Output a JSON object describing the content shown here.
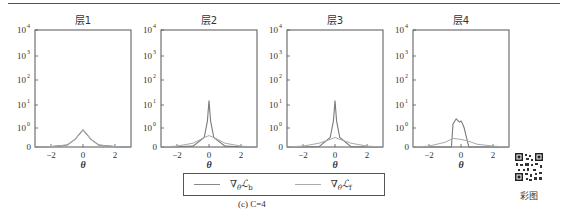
{
  "chart_data": [
    {
      "type": "line",
      "title": "层1",
      "xlabel": "θ",
      "ylabel": "",
      "yscale": "symlog",
      "xlim": [
        -3,
        3
      ],
      "ylim": [
        0,
        10000
      ],
      "xticks": [
        "-2",
        "0",
        "2"
      ],
      "yticks": [
        "0",
        "10^0",
        "10^1",
        "10^2",
        "10^3",
        "10^4"
      ],
      "grid": false,
      "series": [
        {
          "name": "∇θ L_b",
          "x": [
            -3,
            -2,
            -1,
            -0.5,
            0,
            0.5,
            1,
            2,
            3
          ],
          "values": [
            0,
            0.02,
            0.1,
            0.4,
            0.9,
            0.4,
            0.1,
            0.02,
            0
          ]
        },
        {
          "name": "∇θ L_f",
          "x": [
            -3,
            -2,
            -1,
            -0.5,
            0,
            0.5,
            1,
            2,
            3
          ],
          "values": [
            0,
            0.02,
            0.1,
            0.4,
            0.9,
            0.4,
            0.1,
            0.02,
            0
          ]
        }
      ]
    },
    {
      "type": "line",
      "title": "层2",
      "xlabel": "θ",
      "yscale": "symlog",
      "xlim": [
        -3,
        3
      ],
      "ylim": [
        0,
        10000
      ],
      "xticks": [
        "-2",
        "0",
        "2"
      ],
      "yticks": [
        "0",
        "10^0",
        "10^1",
        "10^2",
        "10^3",
        "10^4"
      ],
      "series": [
        {
          "name": "∇θ L_b",
          "x": [
            -3,
            -2,
            -1,
            -0.3,
            -0.1,
            0,
            0.1,
            0.3,
            1,
            2,
            3
          ],
          "values": [
            0,
            0.01,
            0.05,
            0.5,
            2,
            15,
            2,
            0.5,
            0.05,
            0.01,
            0
          ]
        },
        {
          "name": "∇θ L_f",
          "x": [
            -3,
            -2,
            -1,
            -0.3,
            0,
            0.3,
            1,
            2,
            3
          ],
          "values": [
            0,
            0.05,
            0.2,
            0.5,
            0.6,
            0.5,
            0.2,
            0.05,
            0
          ]
        }
      ]
    },
    {
      "type": "line",
      "title": "层3",
      "xlabel": "θ",
      "yscale": "symlog",
      "xlim": [
        -3,
        3
      ],
      "ylim": [
        0,
        10000
      ],
      "xticks": [
        "-2",
        "0",
        "2"
      ],
      "yticks": [
        "0",
        "10^0",
        "10^1",
        "10^2",
        "10^3",
        "10^4"
      ],
      "series": [
        {
          "name": "∇θ L_b",
          "x": [
            -3,
            -2,
            -1,
            -0.3,
            -0.1,
            0,
            0.1,
            0.3,
            1,
            2,
            3
          ],
          "values": [
            0,
            0,
            0.02,
            0.5,
            2,
            15,
            2,
            0.5,
            0.02,
            0,
            0
          ]
        },
        {
          "name": "∇θ L_f",
          "x": [
            -3,
            -2,
            -1,
            -0.3,
            0,
            0.3,
            1,
            2,
            3
          ],
          "values": [
            0,
            0.05,
            0.2,
            0.4,
            0.5,
            0.4,
            0.2,
            0.05,
            0
          ]
        }
      ]
    },
    {
      "type": "line",
      "title": "层4",
      "xlabel": "θ",
      "yscale": "symlog",
      "xlim": [
        -3,
        3
      ],
      "ylim": [
        0,
        10000
      ],
      "xticks": [
        "-2",
        "0",
        "2"
      ],
      "yticks": [
        "0",
        "10^0",
        "10^1",
        "10^2",
        "10^3",
        "10^4"
      ],
      "series": [
        {
          "name": "∇θ L_b",
          "x": [
            -3,
            -0.6,
            -0.5,
            -0.3,
            -0.1,
            0,
            0.1,
            0.2,
            0.4,
            0.5,
            3
          ],
          "values": [
            0,
            0,
            1.5,
            2.5,
            1.8,
            2,
            1.5,
            1,
            0.3,
            0,
            0
          ]
        },
        {
          "name": "∇θ L_f",
          "x": [
            -3,
            -2,
            -1,
            -0.5,
            0,
            0.5,
            1,
            2,
            3
          ],
          "values": [
            0,
            0.05,
            0.25,
            0.45,
            0.4,
            0.3,
            0.15,
            0.05,
            0
          ]
        }
      ]
    }
  ],
  "figure": {
    "panels": [
      {
        "title": "层1"
      },
      {
        "title": "层2"
      },
      {
        "title": "层3"
      },
      {
        "title": "层4"
      }
    ],
    "xlabel": "θ",
    "xticks": [
      "−2",
      "0",
      "2"
    ],
    "yticks": [
      "10",
      "10",
      "10",
      "10",
      "10",
      "0"
    ],
    "ytick_exps": [
      "4",
      "3",
      "2",
      "1",
      "0",
      ""
    ],
    "legend": {
      "items": [
        {
          "label": "∇",
          "sub": "θ",
          "math": "ℒ",
          "msub": "b"
        },
        {
          "label": "∇",
          "sub": "θ",
          "math": "ℒ",
          "msub": "f"
        }
      ]
    },
    "caption": "(c) C=4",
    "qr_label": "彩图"
  },
  "colors": {
    "axis": "#555555",
    "series_b": "#7a7a7a",
    "series_f": "#a8a8a8"
  }
}
